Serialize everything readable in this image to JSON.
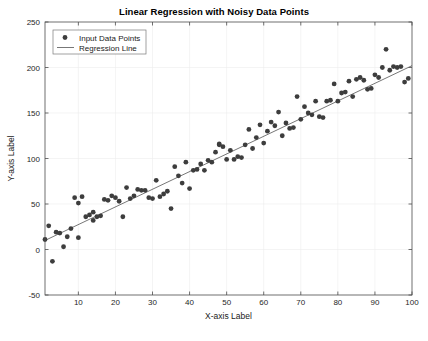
{
  "chart_data": {
    "type": "scatter",
    "title": "Linear Regression with Noisy Data Points",
    "xlabel": "X-axis Label",
    "ylabel": "Y-axis Label",
    "xlim": [
      1,
      100
    ],
    "ylim": [
      -50,
      250
    ],
    "xticks": [
      10,
      20,
      30,
      40,
      50,
      60,
      70,
      80,
      90,
      100
    ],
    "yticks": [
      -50,
      0,
      50,
      100,
      150,
      200,
      250
    ],
    "grid": true,
    "legend_position": "top-left",
    "legend": [
      {
        "label": "Input Data Points",
        "type": "marker",
        "color": "#3d3d3d"
      },
      {
        "label": "Regression Line",
        "type": "line",
        "color": "#545454"
      }
    ],
    "series": [
      {
        "name": "Input Data Points",
        "type": "scatter",
        "marker": "filled-circle",
        "color": "#3d3d3d",
        "points": [
          [
            1,
            11
          ],
          [
            2,
            26
          ],
          [
            3,
            -13
          ],
          [
            4,
            19
          ],
          [
            5,
            18
          ],
          [
            6,
            3
          ],
          [
            7,
            14
          ],
          [
            8,
            23
          ],
          [
            9,
            57
          ],
          [
            10,
            51
          ],
          [
            10,
            13
          ],
          [
            11,
            58
          ],
          [
            12,
            36
          ],
          [
            13,
            38
          ],
          [
            14,
            32
          ],
          [
            14,
            41
          ],
          [
            15,
            36
          ],
          [
            16,
            37
          ],
          [
            17,
            55
          ],
          [
            18,
            54
          ],
          [
            19,
            59
          ],
          [
            20,
            57
          ],
          [
            21,
            53
          ],
          [
            22,
            36
          ],
          [
            23,
            68
          ],
          [
            24,
            56
          ],
          [
            25,
            59
          ],
          [
            26,
            66
          ],
          [
            27,
            65
          ],
          [
            28,
            65
          ],
          [
            29,
            57
          ],
          [
            30,
            56
          ],
          [
            31,
            76
          ],
          [
            32,
            58
          ],
          [
            33,
            61
          ],
          [
            34,
            64
          ],
          [
            35,
            45
          ],
          [
            36,
            91
          ],
          [
            37,
            81
          ],
          [
            38,
            73
          ],
          [
            39,
            96
          ],
          [
            40,
            67
          ],
          [
            41,
            87
          ],
          [
            42,
            88
          ],
          [
            43,
            94
          ],
          [
            44,
            87
          ],
          [
            45,
            98
          ],
          [
            46,
            96
          ],
          [
            47,
            107
          ],
          [
            48,
            115
          ],
          [
            48,
            116
          ],
          [
            49,
            113
          ],
          [
            50,
            99
          ],
          [
            51,
            109
          ],
          [
            52,
            99
          ],
          [
            53,
            102
          ],
          [
            54,
            101
          ],
          [
            55,
            115
          ],
          [
            56,
            132
          ],
          [
            57,
            111
          ],
          [
            58,
            123
          ],
          [
            59,
            137
          ],
          [
            60,
            117
          ],
          [
            61,
            130
          ],
          [
            62,
            140
          ],
          [
            63,
            136
          ],
          [
            64,
            151
          ],
          [
            65,
            125
          ],
          [
            66,
            139
          ],
          [
            67,
            133
          ],
          [
            68,
            134
          ],
          [
            69,
            168
          ],
          [
            70,
            143
          ],
          [
            71,
            157
          ],
          [
            72,
            150
          ],
          [
            73,
            148
          ],
          [
            74,
            163
          ],
          [
            75,
            146
          ],
          [
            76,
            145
          ],
          [
            77,
            163
          ],
          [
            78,
            164
          ],
          [
            79,
            182
          ],
          [
            80,
            163
          ],
          [
            81,
            172
          ],
          [
            82,
            173
          ],
          [
            83,
            185
          ],
          [
            84,
            168
          ],
          [
            85,
            187
          ],
          [
            86,
            189
          ],
          [
            87,
            186
          ],
          [
            88,
            176
          ],
          [
            89,
            177
          ],
          [
            90,
            192
          ],
          [
            91,
            189
          ],
          [
            92,
            200
          ],
          [
            93,
            220
          ],
          [
            94,
            197
          ],
          [
            95,
            201
          ],
          [
            96,
            200
          ],
          [
            97,
            201
          ],
          [
            98,
            184
          ],
          [
            99,
            188
          ]
        ]
      },
      {
        "name": "Regression Line",
        "type": "line",
        "color": "#545454",
        "slope": 1.94,
        "intercept": 8.0,
        "endpoints": [
          [
            1,
            9.94
          ],
          [
            100,
            202.0
          ]
        ]
      }
    ]
  }
}
